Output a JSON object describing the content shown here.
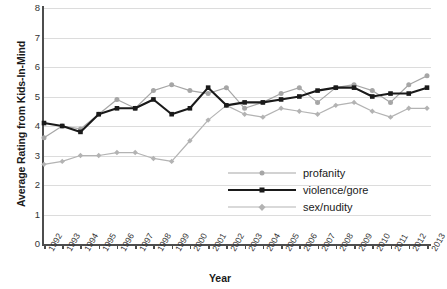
{
  "chart": {
    "title_fragment": "",
    "xlabel": "Year",
    "ylabel": "Average Rating from Kids-In-Mind"
  },
  "legend": {
    "items": [
      {
        "label": "profanity",
        "color": "#a6a6a6",
        "marker": "circle"
      },
      {
        "label": "violence/gore",
        "color": "#1a1a1a",
        "marker": "square"
      },
      {
        "label": "sex/nudity",
        "color": "#b3b3b3",
        "marker": "diamond"
      }
    ]
  },
  "chart_data": {
    "type": "line",
    "title": "",
    "xlabel": "Year",
    "ylabel": "Average Rating from Kids-In-Mind",
    "x": [
      1992,
      1993,
      1994,
      1995,
      1996,
      1997,
      1998,
      1999,
      2000,
      2001,
      2002,
      2003,
      2004,
      2005,
      2006,
      2007,
      2008,
      2009,
      2010,
      2011,
      2012,
      2013
    ],
    "xtick_labels": [
      "1992",
      "1993",
      "1994",
      "1995",
      "1996",
      "1997",
      "1998",
      "1999",
      "2000",
      "2001",
      "2002",
      "2003",
      "2004",
      "2005",
      "2006",
      "2007",
      "2008",
      "2009",
      "2010",
      "2011",
      "2012",
      "2013"
    ],
    "ylim": [
      0,
      8
    ],
    "yticks": [
      0,
      1,
      2,
      3,
      4,
      5,
      6,
      7,
      8
    ],
    "grid": true,
    "legend_position": "center-right-inside",
    "series": [
      {
        "name": "profanity",
        "color": "#a6a6a6",
        "marker": "circle",
        "values": [
          3.6,
          4.0,
          3.9,
          4.4,
          4.9,
          4.6,
          5.2,
          5.4,
          5.2,
          5.1,
          5.3,
          4.6,
          4.8,
          5.1,
          5.3,
          4.8,
          5.3,
          5.4,
          5.2,
          4.8,
          5.4,
          5.7
        ]
      },
      {
        "name": "violence/gore",
        "color": "#1a1a1a",
        "marker": "square",
        "values": [
          4.1,
          4.0,
          3.8,
          4.4,
          4.6,
          4.6,
          4.9,
          4.4,
          4.6,
          5.3,
          4.7,
          4.8,
          4.8,
          4.9,
          5.0,
          5.2,
          5.3,
          5.3,
          5.0,
          5.1,
          5.1,
          5.3
        ]
      },
      {
        "name": "sex/nudity",
        "color": "#b3b3b3",
        "marker": "diamond",
        "values": [
          2.7,
          2.8,
          3.0,
          3.0,
          3.1,
          3.1,
          2.9,
          2.8,
          3.5,
          4.2,
          4.7,
          4.4,
          4.3,
          4.6,
          4.5,
          4.4,
          4.7,
          4.8,
          4.5,
          4.3,
          4.6,
          4.6
        ]
      }
    ]
  }
}
